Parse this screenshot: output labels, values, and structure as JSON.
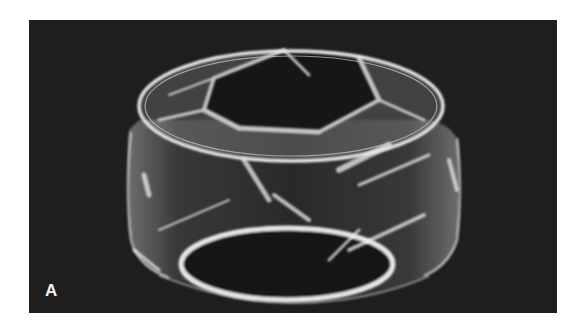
{
  "figure": {
    "panel_label": "A",
    "background_color": "#1e1e1e",
    "page_color": "#ffffff"
  }
}
